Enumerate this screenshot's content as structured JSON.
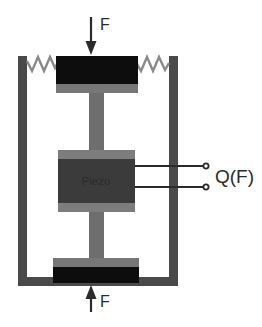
{
  "diagram": {
    "labels": {
      "force_top": "F",
      "force_bottom": "F",
      "piezo": "Piezo",
      "output": "Q(F)"
    },
    "components": {
      "frame": "rigid-housing",
      "spring_left": "spring",
      "spring_right": "spring",
      "top_plate": "top-mass-plate",
      "bottom_plate": "bottom-mass-plate",
      "rod_upper": "connecting-rod",
      "rod_lower": "connecting-rod",
      "piezo_block": "piezoelectric-element",
      "terminal_upper": "output-terminal",
      "terminal_lower": "output-terminal",
      "arrow_top": "force-arrow-down",
      "arrow_bottom": "force-arrow-up"
    },
    "colors": {
      "frame": "#4a4a4a",
      "black_plate": "#0d0d0d",
      "gray_mid": "#6e6e6e",
      "gray_light": "#7d7d7d",
      "piezo_dark": "#3b3b3b",
      "wire": "#2b2b2b",
      "text": "#2b2b2b",
      "background": "#ffffff"
    }
  }
}
